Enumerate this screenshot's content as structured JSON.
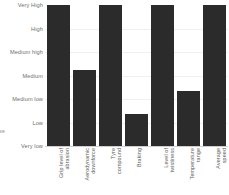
{
  "chart_data": {
    "type": "bar",
    "title": "",
    "xlabel": "",
    "ylabel": "",
    "orientation": "vertical",
    "grid": true,
    "legend": null,
    "bar_color": "#2b2b2b",
    "background_color": "#ffffff",
    "gridline_color": "#f0f0f0",
    "axis_color": "#cfcfcf",
    "scale_type": "ordinal",
    "y_tick_labels": [
      "Very High",
      "High",
      "Medium high",
      "Medium",
      "Medium low",
      "Low",
      "Very low"
    ],
    "y_levels_bottom_to_top": [
      "Very low",
      "Low",
      "Medium low",
      "Medium",
      "Medium high",
      "High",
      "Very High"
    ],
    "ylim": [
      0,
      7
    ],
    "categories": [
      "Grip level of abrasion",
      "Aerodynamic downforce",
      "Tyre compound",
      "Braking",
      "Level of twistiness",
      "Temperature range",
      "Average speed"
    ],
    "value_labels": [
      "Very High",
      "Medium",
      "Very High",
      "Low",
      "Very High",
      "Medium low",
      "Very High"
    ],
    "values": [
      7,
      4,
      7,
      2,
      7,
      3,
      7
    ],
    "bar_height_percent": [
      100,
      54,
      100,
      23,
      100,
      39,
      100
    ]
  },
  "edge_fragment": {
    "text": "we"
  },
  "x_axis_label_lines": [
    [
      "Grip level of",
      "abrasion"
    ],
    [
      "Aerodynamic",
      "downforce"
    ],
    [
      "Tyre",
      "compound"
    ],
    [
      "Braking"
    ],
    [
      "Level of",
      "twistiness"
    ],
    [
      "Temperature",
      "range"
    ],
    [
      "Average",
      "speed"
    ]
  ]
}
